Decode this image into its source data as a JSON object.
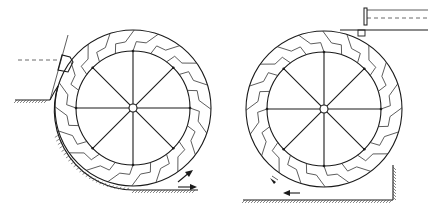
{
  "figure": {
    "stroke_color": "#1a1a1a",
    "background": "#ffffff"
  },
  "wheels": [
    {
      "id": "left",
      "type": "breastshot-wheel",
      "cx": 133,
      "cy": 108,
      "outer_r": 78,
      "inner_r": 57,
      "hub_r": 4,
      "spokes": 8,
      "buckets": 20,
      "bucket_direction": 1,
      "labels": [
        "a",
        "b",
        "a",
        "b"
      ]
    },
    {
      "id": "right",
      "type": "undershot-wheel",
      "cx": 324,
      "cy": 109,
      "outer_r": 78,
      "inner_r": 57,
      "hub_r": 4,
      "spokes": 8,
      "buckets": 20,
      "bucket_direction": -1,
      "labels": []
    }
  ],
  "arrows": [
    {
      "wheel": "left",
      "direction": "up-right"
    },
    {
      "wheel": "left",
      "direction": "right"
    },
    {
      "wheel": "right",
      "direction": "left"
    }
  ]
}
